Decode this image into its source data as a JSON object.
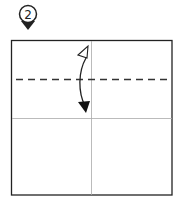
{
  "step": {
    "number": "2",
    "marker_color": "#222222"
  },
  "diagram": {
    "type": "origami-fold-step",
    "paper_color": "#ffffff",
    "border_color": "#222222",
    "crease_color": "#999999",
    "fold_line_style": "valley-dashed",
    "fold_line_color": "#333333",
    "arrow_direction": "fold down and unfold"
  }
}
